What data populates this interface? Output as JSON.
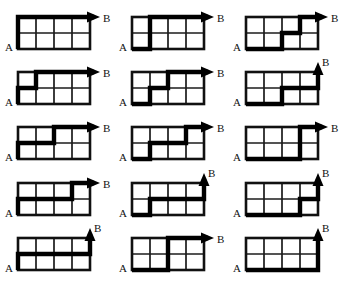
{
  "figure": {
    "title": "",
    "rows": 5,
    "columns": 3,
    "grid": {
      "cols": 4,
      "rows": 2
    },
    "colors": {
      "background": "#ffffff",
      "grid_line": "#1b1b1b",
      "border_line": "#111111",
      "path": "#000000",
      "label": "#111111"
    },
    "labels": {
      "start": "A",
      "end": "B"
    }
  },
  "chart_data": {
    "type": "diagram",
    "title": "",
    "xlabel": "",
    "ylabel": "",
    "grid_width": 4,
    "grid_height": 2,
    "start_label": "A",
    "end_label": "B",
    "start_point": [
      0,
      0
    ],
    "end_point": [
      4,
      2
    ],
    "path_notation": "R = right one unit, U = up one unit",
    "count": 15,
    "diagrams": [
      {
        "index": 1,
        "row": 1,
        "col": 1,
        "start_label": "A",
        "end_label": "B",
        "moves": "UURRRR",
        "points": [
          [
            0,
            0
          ],
          [
            0,
            1
          ],
          [
            0,
            2
          ],
          [
            1,
            2
          ],
          [
            2,
            2
          ],
          [
            3,
            2
          ],
          [
            4,
            2
          ]
        ]
      },
      {
        "index": 2,
        "row": 1,
        "col": 2,
        "start_label": "A",
        "end_label": "B",
        "moves": "RUURRR",
        "points": [
          [
            0,
            0
          ],
          [
            1,
            0
          ],
          [
            1,
            1
          ],
          [
            1,
            2
          ],
          [
            2,
            2
          ],
          [
            3,
            2
          ],
          [
            4,
            2
          ]
        ]
      },
      {
        "index": 3,
        "row": 1,
        "col": 3,
        "start_label": "A",
        "end_label": "B",
        "moves": "RRURUR",
        "points": [
          [
            0,
            0
          ],
          [
            1,
            0
          ],
          [
            2,
            0
          ],
          [
            2,
            1
          ],
          [
            3,
            1
          ],
          [
            3,
            2
          ],
          [
            4,
            2
          ]
        ]
      },
      {
        "index": 4,
        "row": 2,
        "col": 1,
        "start_label": "A",
        "end_label": "B",
        "moves": "URURRR",
        "points": [
          [
            0,
            0
          ],
          [
            0,
            1
          ],
          [
            1,
            1
          ],
          [
            1,
            2
          ],
          [
            2,
            2
          ],
          [
            3,
            2
          ],
          [
            4,
            2
          ]
        ]
      },
      {
        "index": 5,
        "row": 2,
        "col": 2,
        "start_label": "A",
        "end_label": "B",
        "moves": "RURURR",
        "points": [
          [
            0,
            0
          ],
          [
            1,
            0
          ],
          [
            1,
            1
          ],
          [
            2,
            1
          ],
          [
            2,
            2
          ],
          [
            3,
            2
          ],
          [
            4,
            2
          ]
        ]
      },
      {
        "index": 6,
        "row": 2,
        "col": 3,
        "start_label": "A",
        "end_label": "B",
        "moves": "RRURRU",
        "points": [
          [
            0,
            0
          ],
          [
            1,
            0
          ],
          [
            2,
            0
          ],
          [
            2,
            1
          ],
          [
            3,
            1
          ],
          [
            4,
            1
          ],
          [
            4,
            2
          ]
        ]
      },
      {
        "index": 7,
        "row": 3,
        "col": 1,
        "start_label": "A",
        "end_label": "B",
        "moves": "URRURR",
        "points": [
          [
            0,
            0
          ],
          [
            0,
            1
          ],
          [
            1,
            1
          ],
          [
            2,
            1
          ],
          [
            2,
            2
          ],
          [
            3,
            2
          ],
          [
            4,
            2
          ]
        ]
      },
      {
        "index": 8,
        "row": 3,
        "col": 2,
        "start_label": "A",
        "end_label": "B",
        "moves": "RURRUR",
        "points": [
          [
            0,
            0
          ],
          [
            1,
            0
          ],
          [
            1,
            1
          ],
          [
            2,
            1
          ],
          [
            3,
            1
          ],
          [
            3,
            2
          ],
          [
            4,
            2
          ]
        ]
      },
      {
        "index": 9,
        "row": 3,
        "col": 3,
        "start_label": "A",
        "end_label": "B",
        "moves": "RRRUUR",
        "points": [
          [
            0,
            0
          ],
          [
            1,
            0
          ],
          [
            2,
            0
          ],
          [
            3,
            0
          ],
          [
            3,
            1
          ],
          [
            3,
            2
          ],
          [
            4,
            2
          ]
        ]
      },
      {
        "index": 10,
        "row": 4,
        "col": 1,
        "start_label": "A",
        "end_label": "B",
        "moves": "URRRUR",
        "points": [
          [
            0,
            0
          ],
          [
            0,
            1
          ],
          [
            1,
            1
          ],
          [
            2,
            1
          ],
          [
            3,
            1
          ],
          [
            3,
            2
          ],
          [
            4,
            2
          ]
        ]
      },
      {
        "index": 11,
        "row": 4,
        "col": 2,
        "start_label": "A",
        "end_label": "B",
        "moves": "RURRRU",
        "points": [
          [
            0,
            0
          ],
          [
            1,
            0
          ],
          [
            1,
            1
          ],
          [
            2,
            1
          ],
          [
            3,
            1
          ],
          [
            4,
            1
          ],
          [
            4,
            2
          ]
        ]
      },
      {
        "index": 12,
        "row": 4,
        "col": 3,
        "start_label": "A",
        "end_label": "B",
        "moves": "RRRURU",
        "points": [
          [
            0,
            0
          ],
          [
            1,
            0
          ],
          [
            2,
            0
          ],
          [
            3,
            0
          ],
          [
            3,
            1
          ],
          [
            4,
            1
          ],
          [
            4,
            2
          ]
        ]
      },
      {
        "index": 13,
        "row": 5,
        "col": 1,
        "start_label": "A",
        "end_label": "B",
        "moves": "URRRRU",
        "points": [
          [
            0,
            0
          ],
          [
            0,
            1
          ],
          [
            1,
            1
          ],
          [
            2,
            1
          ],
          [
            3,
            1
          ],
          [
            4,
            1
          ],
          [
            4,
            2
          ]
        ]
      },
      {
        "index": 14,
        "row": 5,
        "col": 2,
        "start_label": "A",
        "end_label": "B",
        "moves": "RRUURR",
        "points": [
          [
            0,
            0
          ],
          [
            1,
            0
          ],
          [
            2,
            0
          ],
          [
            2,
            1
          ],
          [
            2,
            2
          ],
          [
            3,
            2
          ],
          [
            4,
            2
          ]
        ]
      },
      {
        "index": 15,
        "row": 5,
        "col": 3,
        "start_label": "A",
        "end_label": "B",
        "moves": "RRRRUU",
        "points": [
          [
            0,
            0
          ],
          [
            1,
            0
          ],
          [
            2,
            0
          ],
          [
            3,
            0
          ],
          [
            4,
            0
          ],
          [
            4,
            1
          ],
          [
            4,
            2
          ]
        ]
      }
    ]
  }
}
